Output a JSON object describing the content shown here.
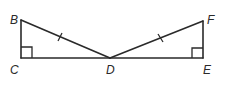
{
  "figure": {
    "points": {
      "B": "B",
      "C": "C",
      "D": "D",
      "E": "E",
      "F": "F"
    },
    "segments": [
      "BC",
      "CD",
      "DE",
      "EF",
      "BD",
      "FD"
    ],
    "right_angles": [
      "C",
      "E"
    ],
    "congruent_marks": [
      {
        "segment": "BD",
        "ticks": 1
      },
      {
        "segment": "FD",
        "ticks": 1
      }
    ],
    "line_color": "#2a2a2a"
  }
}
